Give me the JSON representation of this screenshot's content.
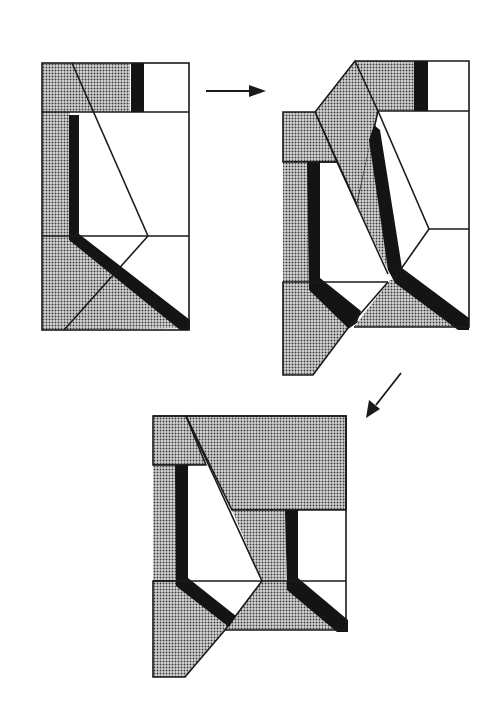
{
  "diagram": {
    "colors": {
      "background": "#ffffff",
      "stroke": "#1a1a1a",
      "stipple_fill": "#b9b9b9",
      "stipple_dot": "#2a2a2a",
      "thick_bar": "#141414"
    },
    "figures": [
      {
        "id": "figure-1",
        "label": "Initial configuration",
        "position": "top-left"
      },
      {
        "id": "figure-2",
        "label": "Intermediate configuration",
        "position": "top-right"
      },
      {
        "id": "figure-3",
        "label": "Final configuration",
        "position": "bottom-center"
      }
    ],
    "arrows": [
      {
        "id": "arrow-1",
        "from": "figure-1",
        "to": "figure-2",
        "direction": "right"
      },
      {
        "id": "arrow-2",
        "from": "figure-2",
        "to": "figure-3",
        "direction": "down-left"
      }
    ]
  }
}
